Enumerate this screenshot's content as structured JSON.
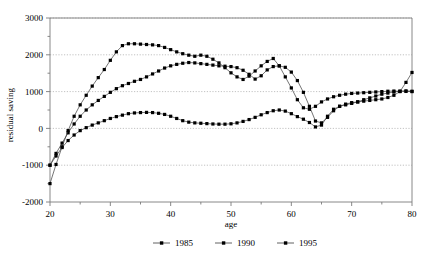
{
  "chart_data": {
    "type": "line",
    "title": "",
    "xlabel": "age",
    "ylabel": "residual saving",
    "xlim": [
      20,
      80
    ],
    "ylim": [
      -2000,
      3000
    ],
    "grid": true,
    "legend_position": "bottom",
    "x_ticks": [
      20,
      30,
      40,
      50,
      60,
      70,
      80
    ],
    "x_minor_ticks": [
      25,
      35,
      45,
      55,
      65,
      75
    ],
    "y_ticks": [
      -2000,
      -1000,
      0,
      1000,
      2000,
      3000
    ],
    "y_minor_ticks": [
      -1500,
      -500,
      500,
      1500,
      2500
    ],
    "marker": "square",
    "series": [
      {
        "name": "1985",
        "x": [
          20,
          21,
          22,
          23,
          24,
          25,
          26,
          27,
          28,
          29,
          30,
          31,
          32,
          33,
          34,
          35,
          36,
          37,
          38,
          39,
          40,
          41,
          42,
          43,
          44,
          45,
          46,
          47,
          48,
          49,
          50,
          51,
          52,
          53,
          54,
          55,
          56,
          57,
          58,
          59,
          60,
          61,
          62,
          63,
          64,
          65,
          66,
          67,
          68,
          69,
          70,
          71,
          72,
          73,
          74,
          75,
          76,
          77,
          78,
          79,
          80
        ],
        "values": [
          -1000,
          -750,
          -520,
          -330,
          -180,
          -60,
          20,
          90,
          150,
          210,
          270,
          320,
          360,
          400,
          420,
          430,
          435,
          430,
          410,
          380,
          330,
          270,
          210,
          170,
          150,
          140,
          130,
          120,
          115,
          115,
          125,
          150,
          190,
          240,
          300,
          370,
          430,
          480,
          500,
          470,
          400,
          320,
          250,
          160,
          40,
          90,
          330,
          520,
          600,
          640,
          680,
          720,
          780,
          830,
          880,
          930,
          960,
          990,
          1010,
          1020,
          1010
        ]
      },
      {
        "name": "1990",
        "x": [
          20,
          21,
          22,
          23,
          24,
          25,
          26,
          27,
          28,
          29,
          30,
          31,
          32,
          33,
          34,
          35,
          36,
          37,
          38,
          39,
          40,
          41,
          42,
          43,
          44,
          45,
          46,
          47,
          48,
          49,
          50,
          51,
          52,
          53,
          54,
          55,
          56,
          57,
          58,
          59,
          60,
          61,
          62,
          63,
          64,
          65,
          66,
          67,
          68,
          69,
          70,
          71,
          72,
          73,
          74,
          75,
          76,
          77,
          78,
          79,
          80
        ],
        "values": [
          -1000,
          -680,
          -400,
          -120,
          120,
          330,
          500,
          640,
          760,
          870,
          980,
          1080,
          1160,
          1220,
          1280,
          1330,
          1400,
          1480,
          1560,
          1640,
          1700,
          1740,
          1770,
          1790,
          1780,
          1760,
          1740,
          1720,
          1700,
          1690,
          1680,
          1650,
          1580,
          1470,
          1340,
          1430,
          1590,
          1680,
          1700,
          1660,
          1530,
          1300,
          980,
          600,
          200,
          150,
          300,
          480,
          600,
          660,
          700,
          720,
          740,
          760,
          780,
          800,
          840,
          900,
          1000,
          1250,
          1520
        ]
      },
      {
        "name": "1995",
        "x": [
          20,
          21,
          22,
          23,
          24,
          25,
          26,
          27,
          28,
          29,
          30,
          31,
          32,
          33,
          34,
          35,
          36,
          37,
          38,
          39,
          40,
          41,
          42,
          43,
          44,
          45,
          46,
          47,
          48,
          49,
          50,
          51,
          52,
          53,
          54,
          55,
          56,
          57,
          58,
          59,
          60,
          61,
          62,
          63,
          64,
          65,
          66,
          67,
          68,
          69,
          70,
          71,
          72,
          73,
          74,
          75,
          76,
          77,
          78,
          79,
          80
        ],
        "values": [
          -1500,
          -980,
          -500,
          -60,
          330,
          640,
          900,
          1150,
          1380,
          1600,
          1850,
          2080,
          2250,
          2300,
          2300,
          2290,
          2280,
          2270,
          2250,
          2200,
          2140,
          2080,
          2030,
          1990,
          1960,
          1990,
          1960,
          1880,
          1780,
          1650,
          1510,
          1400,
          1330,
          1420,
          1560,
          1700,
          1820,
          1900,
          1700,
          1400,
          1100,
          780,
          560,
          520,
          600,
          720,
          800,
          860,
          900,
          930,
          950,
          960,
          970,
          980,
          990,
          1000,
          1010,
          1015,
          1010,
          1005,
          1000
        ]
      }
    ]
  },
  "legend": {
    "entries": [
      {
        "label": "1985"
      },
      {
        "label": "1990"
      },
      {
        "label": "1995"
      }
    ]
  },
  "axis": {
    "y_title": "residual saving",
    "x_title": "age"
  },
  "colors": {
    "series_line": "#3a3a3a",
    "marker": "#000000",
    "grid": "#999999",
    "axis": "#7a7a7a"
  }
}
